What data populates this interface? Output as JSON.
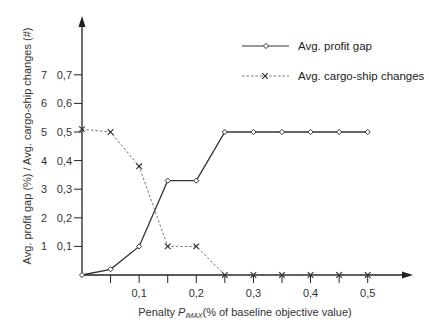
{
  "chart_data": {
    "type": "line",
    "title": "",
    "xlabel_prefix": "Penalty ",
    "xlabel_symbol": "P",
    "xlabel_subscript": "IMAX",
    "xlabel_suffix": "(% of baseline objective value)",
    "ylabel": "Avg. profit gap (%) / Avg. cargo-ship changes (#)",
    "x": [
      0,
      0.05,
      0.1,
      0.15,
      0.2,
      0.25,
      0.3,
      0.35,
      0.4,
      0.45,
      0.5
    ],
    "xlim": [
      0,
      0.55
    ],
    "ylim": [
      0,
      0.8
    ],
    "x_ticks": [
      0.05,
      0.1,
      0.15,
      0.2,
      0.25,
      0.3,
      0.35,
      0.4,
      0.45,
      0.5
    ],
    "x_tick_labels": [
      {
        "value": 0.1,
        "label": "0,1"
      },
      {
        "value": 0.2,
        "label": "0,2"
      },
      {
        "value": 0.3,
        "label": "0,3"
      },
      {
        "value": 0.4,
        "label": "0,4"
      },
      {
        "value": 0.5,
        "label": "0,5"
      }
    ],
    "y_ticks": [
      {
        "value": 0.1,
        "label": "0,1",
        "label_count": "1"
      },
      {
        "value": 0.2,
        "label": "0,2",
        "label_count": "2"
      },
      {
        "value": 0.3,
        "label": "0,3",
        "label_count": "3"
      },
      {
        "value": 0.4,
        "label": "0,4",
        "label_count": "4"
      },
      {
        "value": 0.5,
        "label": "0,5",
        "label_count": "5"
      },
      {
        "value": 0.6,
        "label": "0,6",
        "label_count": "6"
      },
      {
        "value": 0.7,
        "label": "0,7",
        "label_count": "7"
      }
    ],
    "grid": false,
    "legend_position": "top-right",
    "series": [
      {
        "name": "Avg. profit gap",
        "unit": "%",
        "style": "solid",
        "marker": "diamond",
        "values": [
          0,
          0.02,
          0.1,
          0.33,
          0.33,
          0.5,
          0.5,
          0.5,
          0.5,
          0.5,
          0.5
        ]
      },
      {
        "name": "Avg. cargo-ship changes",
        "unit": "#",
        "style": "dashed",
        "marker": "x",
        "values": [
          5.1,
          5.0,
          3.8,
          1.0,
          1.0,
          0,
          0,
          0,
          0,
          0,
          0
        ],
        "scale_to_axis": 0.1
      }
    ]
  },
  "colors": {
    "axis": "#222222",
    "profit_line": "#333333",
    "cargo_line": "#777777"
  }
}
